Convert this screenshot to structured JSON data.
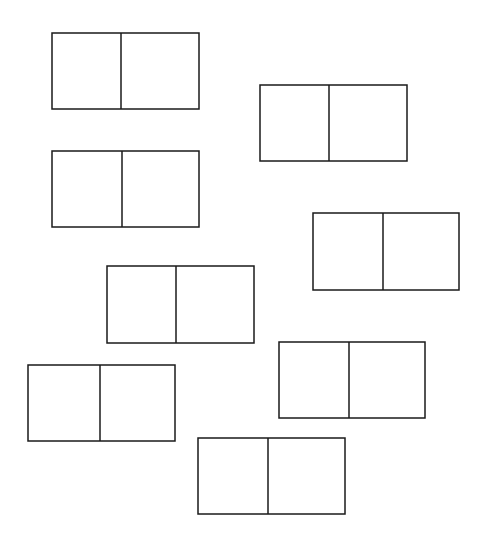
{
  "canvas": {
    "width": 483,
    "height": 546,
    "background": "#ffffff"
  },
  "style": {
    "stroke": "#1a1a1a",
    "stroke_width": 1.5,
    "fill": "#ffffff"
  },
  "dominoes": [
    {
      "id": 1,
      "x": 52,
      "y": 33,
      "w": 147,
      "h": 76,
      "divider_x": 121
    },
    {
      "id": 2,
      "x": 260,
      "y": 85,
      "w": 147,
      "h": 76,
      "divider_x": 329
    },
    {
      "id": 3,
      "x": 52,
      "y": 151,
      "w": 147,
      "h": 76,
      "divider_x": 122
    },
    {
      "id": 4,
      "x": 313,
      "y": 213,
      "w": 146,
      "h": 77,
      "divider_x": 383
    },
    {
      "id": 5,
      "x": 107,
      "y": 266,
      "w": 147,
      "h": 77,
      "divider_x": 176
    },
    {
      "id": 6,
      "x": 28,
      "y": 365,
      "w": 147,
      "h": 76,
      "divider_x": 100
    },
    {
      "id": 7,
      "x": 279,
      "y": 342,
      "w": 146,
      "h": 76,
      "divider_x": 349
    },
    {
      "id": 8,
      "x": 198,
      "y": 438,
      "w": 147,
      "h": 76,
      "divider_x": 268
    }
  ]
}
